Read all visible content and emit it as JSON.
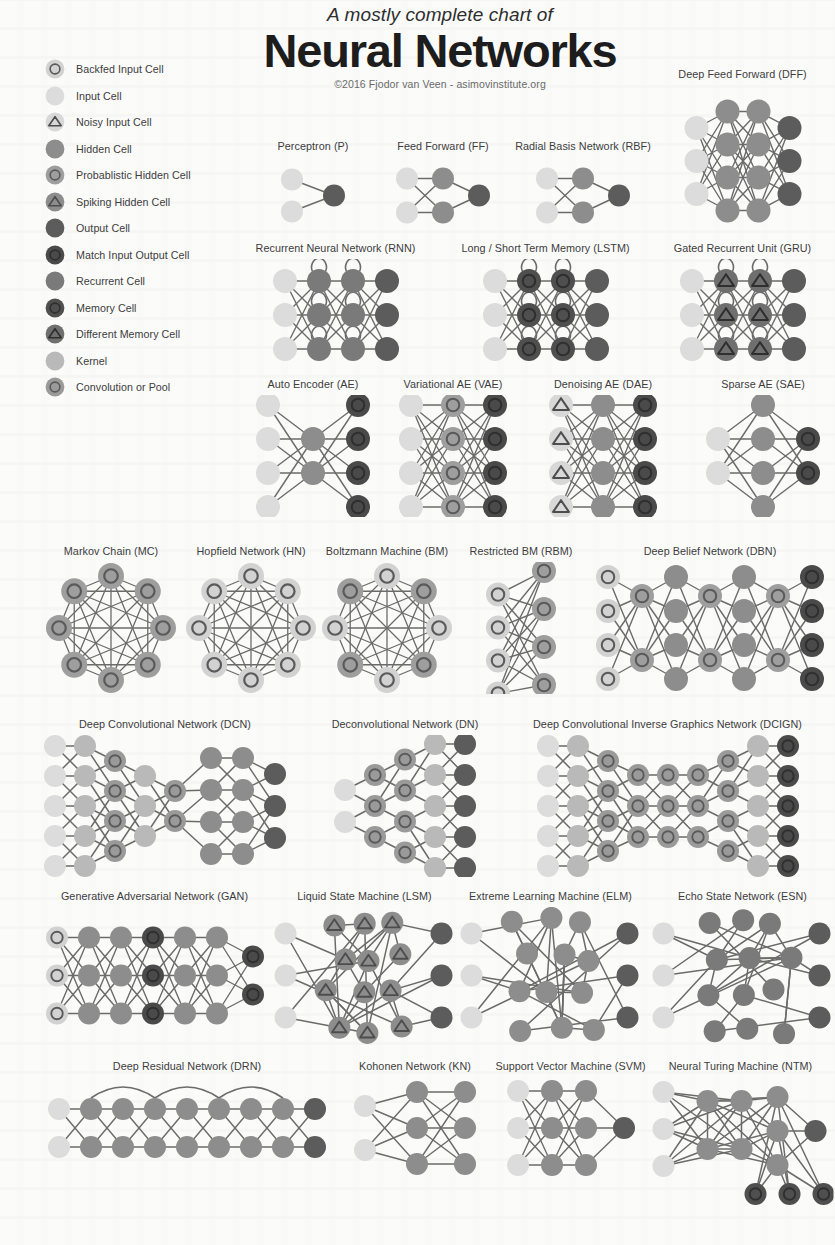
{
  "header": {
    "subtitle": "A mostly complete chart of",
    "title": "Neural Networks",
    "credit": "©2016 Fjodor van Veen - asimovinstitute.org"
  },
  "palette": {
    "input": "#dcdcdc",
    "hidden": "#8d8d8d",
    "output": "#5c5c5c",
    "match": "#4a4a4a",
    "recurrent": "#7a7a7a",
    "memory": "#4f4f4f",
    "diff_memory": "#6f6f6f",
    "kernel": "#b9b9b9",
    "conv": "#9a9a9a",
    "prob": "#9e9e9e",
    "spiking": "#8d8d8d",
    "backfed": "#d2d2d2",
    "noisy": "#d8d8d8",
    "edge": "#6b6b6b",
    "ring": "#4a4a4a"
  },
  "legend": {
    "items": [
      {
        "label": "Backfed Input Cell",
        "cell": "backfed"
      },
      {
        "label": "Input Cell",
        "cell": "input"
      },
      {
        "label": "Noisy Input Cell",
        "cell": "noisy"
      },
      {
        "label": "Hidden Cell",
        "cell": "hidden"
      },
      {
        "label": "Probablistic Hidden Cell",
        "cell": "prob"
      },
      {
        "label": "Spiking Hidden Cell",
        "cell": "spiking"
      },
      {
        "label": "Output Cell",
        "cell": "output"
      },
      {
        "label": "Match Input Output Cell",
        "cell": "match"
      },
      {
        "label": "Recurrent Cell",
        "cell": "recurrent"
      },
      {
        "label": "Memory Cell",
        "cell": "memory"
      },
      {
        "label": "Different Memory Cell",
        "cell": "diff_memory"
      },
      {
        "label": "Kernel",
        "cell": "kernel"
      },
      {
        "label": "Convolution or Pool",
        "cell": "conv"
      }
    ]
  },
  "networks": [
    {
      "id": "perceptron",
      "name": "Perceptron (P)",
      "x": 238,
      "y": 140,
      "w": 150,
      "h": 95,
      "r": 11,
      "layers": [
        {
          "cell": "input",
          "n": 2,
          "dx": 0,
          "gap": 32
        },
        {
          "cell": "output",
          "n": 1,
          "dx": 42,
          "gap": 32
        }
      ],
      "connect": "full"
    },
    {
      "id": "feed-forward",
      "name": "Feed Forward (FF)",
      "x": 368,
      "y": 140,
      "w": 150,
      "h": 95,
      "r": 11,
      "layers": [
        {
          "cell": "input",
          "n": 2,
          "dx": 0,
          "gap": 34
        },
        {
          "cell": "hidden",
          "n": 2,
          "dx": 36,
          "gap": 34
        },
        {
          "cell": "output",
          "n": 1,
          "dx": 36,
          "gap": 34
        }
      ],
      "connect": "full"
    },
    {
      "id": "radial-basis",
      "name": "Radial Basis Network (RBF)",
      "x": 498,
      "y": 140,
      "w": 170,
      "h": 95,
      "r": 11,
      "layers": [
        {
          "cell": "input",
          "n": 2,
          "dx": 0,
          "gap": 34
        },
        {
          "cell": "hidden",
          "n": 2,
          "dx": 36,
          "gap": 34
        },
        {
          "cell": "output",
          "n": 1,
          "dx": 36,
          "gap": 34
        }
      ],
      "connect": "full"
    },
    {
      "id": "deep-feed-forward",
      "name": "Deep Feed Forward (DFF)",
      "x": 655,
      "y": 68,
      "w": 175,
      "h": 170,
      "r": 12,
      "layers": [
        {
          "cell": "input",
          "n": 3,
          "dx": 0,
          "gap": 33,
          "oy": 0
        },
        {
          "cell": "hidden",
          "n": 4,
          "dx": 31,
          "gap": 33,
          "oy": 0
        },
        {
          "cell": "hidden",
          "n": 4,
          "dx": 31,
          "gap": 33,
          "oy": 0
        },
        {
          "cell": "output",
          "n": 3,
          "dx": 31,
          "gap": 33,
          "oy": 0
        }
      ],
      "connect": "full"
    },
    {
      "id": "rnn",
      "name": "Recurrent Neural Network (RNN)",
      "x": 238,
      "y": 242,
      "w": 195,
      "h": 130,
      "r": 12,
      "layers": [
        {
          "cell": "input",
          "n": 3,
          "dx": 0,
          "gap": 34
        },
        {
          "cell": "recurrent",
          "n": 3,
          "dx": 34,
          "gap": 34,
          "loop": true
        },
        {
          "cell": "recurrent",
          "n": 3,
          "dx": 34,
          "gap": 34,
          "loop": true
        },
        {
          "cell": "output",
          "n": 3,
          "dx": 34,
          "gap": 34
        }
      ],
      "connect": "full"
    },
    {
      "id": "lstm",
      "name": "Long / Short Term Memory (LSTM)",
      "x": 448,
      "y": 242,
      "w": 195,
      "h": 130,
      "r": 12,
      "layers": [
        {
          "cell": "input",
          "n": 3,
          "dx": 0,
          "gap": 34
        },
        {
          "cell": "memory",
          "n": 3,
          "dx": 34,
          "gap": 34,
          "loop": true
        },
        {
          "cell": "memory",
          "n": 3,
          "dx": 34,
          "gap": 34,
          "loop": true
        },
        {
          "cell": "output",
          "n": 3,
          "dx": 34,
          "gap": 34
        }
      ],
      "connect": "full"
    },
    {
      "id": "gru",
      "name": "Gated Recurrent Unit (GRU)",
      "x": 650,
      "y": 242,
      "w": 185,
      "h": 130,
      "r": 12,
      "layers": [
        {
          "cell": "input",
          "n": 3,
          "dx": 0,
          "gap": 34
        },
        {
          "cell": "diff_memory",
          "n": 3,
          "dx": 34,
          "gap": 34,
          "loop": true
        },
        {
          "cell": "diff_memory",
          "n": 3,
          "dx": 34,
          "gap": 34,
          "loop": true
        },
        {
          "cell": "output",
          "n": 3,
          "dx": 34,
          "gap": 34
        }
      ],
      "connect": "full"
    },
    {
      "id": "auto-encoder",
      "name": "Auto Encoder (AE)",
      "x": 238,
      "y": 378,
      "w": 150,
      "h": 140,
      "r": 12,
      "layers": [
        {
          "cell": "input",
          "n": 4,
          "dx": 0,
          "gap": 34
        },
        {
          "cell": "hidden",
          "n": 2,
          "dx": 45,
          "gap": 34
        },
        {
          "cell": "match",
          "n": 4,
          "dx": 45,
          "gap": 34
        }
      ],
      "connect": "full"
    },
    {
      "id": "variational-ae",
      "name": "Variational AE (VAE)",
      "x": 378,
      "y": 378,
      "w": 150,
      "h": 140,
      "r": 12,
      "layers": [
        {
          "cell": "input",
          "n": 4,
          "dx": 0,
          "gap": 34
        },
        {
          "cell": "prob",
          "n": 4,
          "dx": 42,
          "gap": 34
        },
        {
          "cell": "match",
          "n": 4,
          "dx": 42,
          "gap": 34
        }
      ],
      "connect": "full"
    },
    {
      "id": "denoising-ae",
      "name": "Denoising AE (DAE)",
      "x": 528,
      "y": 378,
      "w": 150,
      "h": 140,
      "r": 12,
      "layers": [
        {
          "cell": "noisy",
          "n": 4,
          "dx": 0,
          "gap": 34
        },
        {
          "cell": "hidden",
          "n": 4,
          "dx": 42,
          "gap": 34
        },
        {
          "cell": "match",
          "n": 4,
          "dx": 42,
          "gap": 34
        }
      ],
      "connect": "full"
    },
    {
      "id": "sparse-ae",
      "name": "Sparse AE (SAE)",
      "x": 688,
      "y": 378,
      "w": 150,
      "h": 140,
      "r": 12,
      "layers": [
        {
          "cell": "input",
          "n": 2,
          "dx": 0,
          "gap": 34,
          "oy": 0
        },
        {
          "cell": "hidden",
          "n": 4,
          "dx": 45,
          "gap": 34,
          "oy": 0
        },
        {
          "cell": "match",
          "n": 2,
          "dx": 45,
          "gap": 34,
          "oy": 0
        }
      ],
      "connect": "full"
    },
    {
      "id": "markov-chain",
      "name": "Markov Chain (MC)",
      "x": 36,
      "y": 545,
      "w": 150,
      "h": 150,
      "r": 13,
      "ring": {
        "cell": "prob",
        "n": 8,
        "radius": 52
      }
    },
    {
      "id": "hopfield",
      "name": "Hopfield Network (HN)",
      "x": 176,
      "y": 545,
      "w": 150,
      "h": 150,
      "r": 13,
      "ring": {
        "cell": "backfed",
        "n": 8,
        "radius": 52
      }
    },
    {
      "id": "boltzmann",
      "name": "Boltzmann Machine (BM)",
      "x": 312,
      "y": 545,
      "w": 150,
      "h": 150,
      "r": 13,
      "ring": {
        "cell": "backfed",
        "n": 8,
        "radius": 52,
        "alt": "prob"
      }
    },
    {
      "id": "restricted-bm",
      "name": "Restricted BM (RBM)",
      "x": 456,
      "y": 545,
      "w": 130,
      "h": 150,
      "r": 12,
      "layers": [
        {
          "cell": "backfed",
          "n": 4,
          "dx": 0,
          "gap": 33,
          "oy": 16
        },
        {
          "cell": "prob",
          "n": 4,
          "dx": 46,
          "gap": 38,
          "oy": 0
        }
      ],
      "connect": "full"
    },
    {
      "id": "deep-belief",
      "name": "Deep Belief Network (DBN)",
      "x": 590,
      "y": 545,
      "w": 240,
      "h": 150,
      "r": 12,
      "layers": [
        {
          "cell": "backfed",
          "n": 4,
          "dx": 0,
          "gap": 34,
          "oy": 0
        },
        {
          "cell": "prob",
          "n": 2,
          "dx": 34,
          "gap": 64,
          "oy": 0
        },
        {
          "cell": "hidden",
          "n": 4,
          "dx": 34,
          "gap": 34,
          "oy": 0
        },
        {
          "cell": "prob",
          "n": 2,
          "dx": 34,
          "gap": 64,
          "oy": 0
        },
        {
          "cell": "hidden",
          "n": 4,
          "dx": 34,
          "gap": 34,
          "oy": 0
        },
        {
          "cell": "prob",
          "n": 2,
          "dx": 34,
          "gap": 64,
          "oy": 0
        },
        {
          "cell": "match",
          "n": 4,
          "dx": 34,
          "gap": 34,
          "oy": 0
        }
      ],
      "connect": "full"
    },
    {
      "id": "deep-convolutional",
      "name": "Deep Convolutional Network (DCN)",
      "x": 30,
      "y": 718,
      "w": 270,
      "h": 160,
      "r": 11,
      "layers": [
        {
          "cell": "input",
          "n": 5,
          "dx": 0,
          "gap": 30,
          "oy": 0
        },
        {
          "cell": "kernel",
          "n": 5,
          "dx": 30,
          "gap": 30,
          "oy": 0
        },
        {
          "cell": "conv",
          "n": 4,
          "dx": 30,
          "gap": 30,
          "oy": 0
        },
        {
          "cell": "kernel",
          "n": 3,
          "dx": 30,
          "gap": 30,
          "oy": 0
        },
        {
          "cell": "conv",
          "n": 2,
          "dx": 30,
          "gap": 30,
          "oy": 0
        },
        {
          "cell": "hidden",
          "n": 4,
          "dx": 36,
          "gap": 32,
          "oy": 0
        },
        {
          "cell": "hidden",
          "n": 4,
          "dx": 32,
          "gap": 32,
          "oy": 0
        },
        {
          "cell": "output",
          "n": 3,
          "dx": 32,
          "gap": 32,
          "oy": 0
        }
      ],
      "connect": "cone"
    },
    {
      "id": "deconvolutional",
      "name": "Deconvolutional Network (DN)",
      "x": 310,
      "y": 718,
      "w": 190,
      "h": 160,
      "r": 11,
      "layers": [
        {
          "cell": "input",
          "n": 2,
          "dx": 0,
          "gap": 32,
          "oy": 0
        },
        {
          "cell": "conv",
          "n": 3,
          "dx": 30,
          "gap": 31,
          "oy": 0
        },
        {
          "cell": "conv",
          "n": 4,
          "dx": 30,
          "gap": 31,
          "oy": 0
        },
        {
          "cell": "kernel",
          "n": 5,
          "dx": 30,
          "gap": 31,
          "oy": 0
        },
        {
          "cell": "output",
          "n": 5,
          "dx": 30,
          "gap": 31,
          "oy": 0
        }
      ],
      "connect": "cone"
    },
    {
      "id": "dcign",
      "name": "Deep Convolutional Inverse Graphics Network (DCIGN)",
      "x": 500,
      "y": 718,
      "w": 335,
      "h": 160,
      "r": 11,
      "layers": [
        {
          "cell": "input",
          "n": 5,
          "dx": 0,
          "gap": 30,
          "oy": 0
        },
        {
          "cell": "kernel",
          "n": 5,
          "dx": 30,
          "gap": 30,
          "oy": 0
        },
        {
          "cell": "conv",
          "n": 4,
          "dx": 30,
          "gap": 30,
          "oy": 0
        },
        {
          "cell": "conv",
          "n": 3,
          "dx": 30,
          "gap": 31,
          "oy": 0
        },
        {
          "cell": "conv",
          "n": 3,
          "dx": 30,
          "gap": 31,
          "oy": 0
        },
        {
          "cell": "conv",
          "n": 3,
          "dx": 30,
          "gap": 31,
          "oy": 0
        },
        {
          "cell": "conv",
          "n": 4,
          "dx": 30,
          "gap": 30,
          "oy": 0
        },
        {
          "cell": "kernel",
          "n": 5,
          "dx": 30,
          "gap": 30,
          "oy": 0
        },
        {
          "cell": "match",
          "n": 5,
          "dx": 30,
          "gap": 30,
          "oy": 0
        }
      ],
      "connect": "cone"
    },
    {
      "id": "gan",
      "name": "Generative Adversarial Network (GAN)",
      "x": 32,
      "y": 890,
      "w": 245,
      "h": 155,
      "r": 11,
      "layers": [
        {
          "cell": "backfed",
          "n": 3,
          "dx": 0,
          "gap": 38,
          "oy": 0
        },
        {
          "cell": "hidden",
          "n": 3,
          "dx": 32,
          "gap": 38,
          "oy": 0
        },
        {
          "cell": "hidden",
          "n": 3,
          "dx": 32,
          "gap": 38,
          "oy": 0
        },
        {
          "cell": "match",
          "n": 3,
          "dx": 32,
          "gap": 38,
          "oy": 0
        },
        {
          "cell": "hidden",
          "n": 3,
          "dx": 32,
          "gap": 38,
          "oy": 0
        },
        {
          "cell": "hidden",
          "n": 3,
          "dx": 32,
          "gap": 38,
          "oy": 0
        },
        {
          "cell": "match",
          "n": 2,
          "dx": 36,
          "gap": 38,
          "oy": 0
        }
      ],
      "connect": "full"
    },
    {
      "id": "liquid-state",
      "name": "Liquid State Machine (LSM)",
      "x": 272,
      "y": 890,
      "w": 185,
      "h": 155,
      "r": 11,
      "mesh": {
        "inputs": {
          "cell": "input",
          "n": 3,
          "gap": 42
        },
        "body": {
          "cell": "spiking",
          "rows": 4,
          "cols": 3,
          "gapx": 33,
          "gapy": 36
        },
        "outputs": {
          "cell": "output",
          "n": 3,
          "gap": 42
        }
      }
    },
    {
      "id": "extreme-learning",
      "name": "Extreme Learning Machine (ELM)",
      "x": 458,
      "y": 890,
      "w": 185,
      "h": 155,
      "r": 11,
      "mesh": {
        "inputs": {
          "cell": "input",
          "n": 3,
          "gap": 42
        },
        "body": {
          "cell": "hidden",
          "rows": 4,
          "cols": 3,
          "gapx": 33,
          "gapy": 36
        },
        "outputs": {
          "cell": "output",
          "n": 3,
          "gap": 42
        }
      }
    },
    {
      "id": "echo-state",
      "name": "Echo State Network (ESN)",
      "x": 650,
      "y": 890,
      "w": 185,
      "h": 155,
      "r": 11,
      "mesh": {
        "inputs": {
          "cell": "input",
          "n": 3,
          "gap": 42
        },
        "body": {
          "cell": "recurrent",
          "rows": 4,
          "cols": 3,
          "gapx": 33,
          "gapy": 36
        },
        "outputs": {
          "cell": "output",
          "n": 3,
          "gap": 42
        }
      }
    },
    {
      "id": "deep-residual",
      "name": "Deep Residual Network (DRN)",
      "x": 42,
      "y": 1060,
      "w": 290,
      "h": 120,
      "r": 11,
      "layers": [
        {
          "cell": "input",
          "n": 2,
          "dx": 0,
          "gap": 38,
          "oy": 0
        },
        {
          "cell": "hidden",
          "n": 2,
          "dx": 32,
          "gap": 38,
          "oy": 0
        },
        {
          "cell": "hidden",
          "n": 2,
          "dx": 32,
          "gap": 38,
          "oy": 0
        },
        {
          "cell": "hidden",
          "n": 2,
          "dx": 32,
          "gap": 38,
          "oy": 0
        },
        {
          "cell": "hidden",
          "n": 2,
          "dx": 32,
          "gap": 38,
          "oy": 0
        },
        {
          "cell": "hidden",
          "n": 2,
          "dx": 32,
          "gap": 38,
          "oy": 0
        },
        {
          "cell": "hidden",
          "n": 2,
          "dx": 32,
          "gap": 38,
          "oy": 0
        },
        {
          "cell": "hidden",
          "n": 2,
          "dx": 32,
          "gap": 38,
          "oy": 0
        },
        {
          "cell": "output",
          "n": 2,
          "dx": 32,
          "gap": 38,
          "oy": 0
        }
      ],
      "connect": "full",
      "skips": [
        [
          1,
          3
        ],
        [
          3,
          5
        ],
        [
          5,
          7
        ]
      ]
    },
    {
      "id": "kohonen",
      "name": "Kohonen Network (KN)",
      "x": 340,
      "y": 1060,
      "w": 150,
      "h": 120,
      "r": 11,
      "layers": [
        {
          "cell": "input",
          "n": 2,
          "dx": 0,
          "gap": 44,
          "oy": 0
        },
        {
          "cell": "hidden",
          "n": 3,
          "dx": 52,
          "gap": 36,
          "oy": 0
        },
        {
          "cell": "hidden",
          "n": 3,
          "dx": 48,
          "gap": 36,
          "oy": 0
        }
      ],
      "connect": "full"
    },
    {
      "id": "svm",
      "name": "Support Vector Machine (SVM)",
      "x": 488,
      "y": 1060,
      "w": 165,
      "h": 120,
      "r": 11,
      "layers": [
        {
          "cell": "input",
          "n": 3,
          "dx": 0,
          "gap": 37,
          "oy": 0
        },
        {
          "cell": "hidden",
          "n": 3,
          "dx": 34,
          "gap": 37,
          "oy": 0
        },
        {
          "cell": "hidden",
          "n": 3,
          "dx": 34,
          "gap": 37,
          "oy": 0
        },
        {
          "cell": "output",
          "n": 1,
          "dx": 38,
          "gap": 37,
          "oy": 0
        }
      ],
      "connect": "full"
    },
    {
      "id": "ntm",
      "name": "Neural Turing Machine (NTM)",
      "x": 648,
      "y": 1060,
      "w": 185,
      "h": 150,
      "r": 11,
      "ntm": {
        "inputs": {
          "cell": "input",
          "n": 3,
          "gap": 37
        },
        "hidden": {
          "cell": "hidden",
          "rows": 2,
          "cols": 2,
          "gapx": 34,
          "gapy": 48
        },
        "stack": {
          "cell": "hidden",
          "n": 3,
          "gap": 34
        },
        "output": {
          "cell": "output",
          "n": 1
        },
        "memory": {
          "cell": "memory",
          "n": 3,
          "gap": 34
        }
      }
    }
  ]
}
